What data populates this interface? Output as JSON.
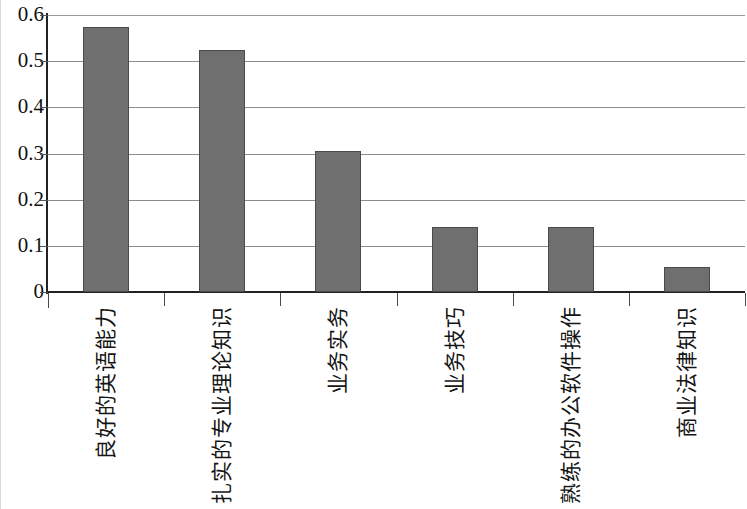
{
  "chart_data": {
    "type": "bar",
    "title": "",
    "subtitle": "",
    "xlabel": "",
    "ylabel": "",
    "categories": [
      "良好的英语能力",
      "扎实的专业理论知识",
      "业务实务",
      "业务技巧",
      "熟练的办公软件操作",
      "商业法律知识"
    ],
    "values": [
      0.575,
      0.525,
      0.305,
      0.14,
      0.14,
      0.055
    ],
    "series": [
      {
        "name": "",
        "values": [
          0.575,
          0.525,
          0.305,
          0.14,
          0.14,
          0.055
        ]
      }
    ],
    "ylim": [
      0,
      0.6
    ],
    "ytick_labels": [
      "0.6",
      "0.5",
      "0.4",
      "0.3",
      "0.2",
      "0.1",
      "0"
    ],
    "ytick_values": [
      0.6,
      0.5,
      0.4,
      0.3,
      0.2,
      0.1,
      0
    ],
    "grid": true,
    "grid_axis": "y",
    "legend": false,
    "legend_position": "none",
    "bar_color": "#6f6f6f",
    "bar_border_color": "#4a4a4a",
    "gridline_color": "#8c8c8c",
    "axis_color": "#222222",
    "background_color": "#ffffff",
    "label_rotation": -90
  }
}
